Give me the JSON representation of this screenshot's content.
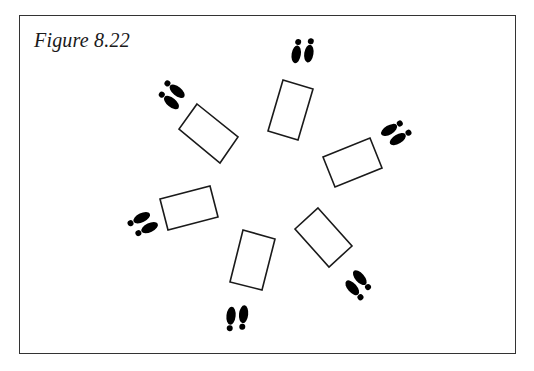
{
  "figure": {
    "caption": "Figure 8.22",
    "line_color": "#1a1a1a",
    "footprint_color": "#000000",
    "stations": [
      {
        "name": "upper-left",
        "rect": "197,104 238,137 220,163 179,129",
        "feet": {
          "x": 172,
          "y": 95,
          "rotate": 135
        }
      },
      {
        "name": "top",
        "rect": "283,80 313,89 298,140 268,131",
        "feet": {
          "x": 303,
          "y": 51,
          "rotate": 195
        }
      },
      {
        "name": "right",
        "rect": "323,157 370,138 382,168 335,187",
        "feet": {
          "x": 396,
          "y": 133,
          "rotate": 245
        }
      },
      {
        "name": "lower-right",
        "rect": "318,208 352,246 329,267 295,229",
        "feet": {
          "x": 358,
          "y": 285,
          "rotate": 325
        }
      },
      {
        "name": "bottom",
        "rect": "243,230 275,239 262,290 230,282",
        "feet": {
          "x": 237,
          "y": 318,
          "rotate": 12
        }
      },
      {
        "name": "left",
        "rect": "160,199 210,186 218,217 168,230",
        "feet": {
          "x": 143,
          "y": 224,
          "rotate": 70
        }
      }
    ]
  }
}
